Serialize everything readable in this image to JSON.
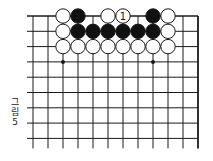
{
  "diagram": {
    "type": "go-board-fragment",
    "caption": [
      "그",
      "림",
      "5"
    ],
    "grid": {
      "x0": 33,
      "y0": 16,
      "spacing_x": 15,
      "spacing_y": 15.3,
      "cols": 12,
      "rows": 9,
      "left_extension": 6,
      "bottom_extension": 10,
      "top_edge": true,
      "right_edge": true
    },
    "star_points": [
      [
        2,
        3
      ],
      [
        8,
        3
      ]
    ],
    "stones": [
      {
        "col": 2,
        "row": 0,
        "color": "white"
      },
      {
        "col": 3,
        "row": 0,
        "color": "black"
      },
      {
        "col": 5,
        "row": 0,
        "color": "white"
      },
      {
        "col": 6,
        "row": 0,
        "color": "white",
        "label": "1"
      },
      {
        "col": 8,
        "row": 0,
        "color": "black"
      },
      {
        "col": 9,
        "row": 0,
        "color": "white"
      },
      {
        "col": 2,
        "row": 1,
        "color": "white"
      },
      {
        "col": 3,
        "row": 1,
        "color": "black"
      },
      {
        "col": 4,
        "row": 1,
        "color": "black"
      },
      {
        "col": 5,
        "row": 1,
        "color": "black"
      },
      {
        "col": 6,
        "row": 1,
        "color": "black"
      },
      {
        "col": 7,
        "row": 1,
        "color": "black"
      },
      {
        "col": 8,
        "row": 1,
        "color": "black"
      },
      {
        "col": 9,
        "row": 1,
        "color": "white"
      },
      {
        "col": 2,
        "row": 2,
        "color": "white"
      },
      {
        "col": 3,
        "row": 2,
        "color": "white"
      },
      {
        "col": 4,
        "row": 2,
        "color": "white"
      },
      {
        "col": 5,
        "row": 2,
        "color": "white"
      },
      {
        "col": 6,
        "row": 2,
        "color": "white"
      },
      {
        "col": 7,
        "row": 2,
        "color": "white"
      },
      {
        "col": 8,
        "row": 2,
        "color": "white"
      },
      {
        "col": 9,
        "row": 2,
        "color": "white"
      }
    ],
    "colors": {
      "line": "#1a1a1a",
      "black_stone": "#111111",
      "white_stone": "#ffffff",
      "background": "#ffffff"
    }
  }
}
